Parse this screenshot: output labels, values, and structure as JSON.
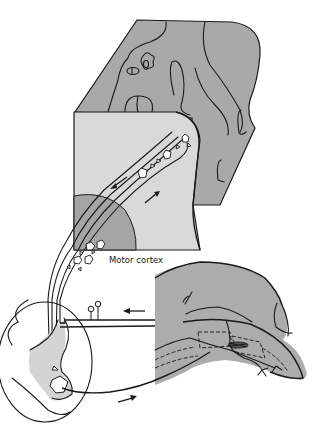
{
  "diagram": {
    "type": "anatomical-schematic",
    "labels": {
      "motor_cortex": "Motor cortex"
    },
    "colors": {
      "brain_surface": "#a9a9a9",
      "cortex_section": "#d9d9d9",
      "cortex_deep_region": "#a5a5a5",
      "spinal_cord_gray": "#d4d4d4",
      "hand": "#acacac",
      "ink": "#1a1a1a",
      "background": "#ffffff"
    },
    "arrows": [
      {
        "id": "descending",
        "direction": "down-left",
        "location": "motor cortex section, upper tract"
      },
      {
        "id": "ascending",
        "direction": "up-right",
        "location": "motor cortex section, lower tract"
      },
      {
        "id": "afferent-left",
        "direction": "left",
        "location": "sensory fiber from finger"
      },
      {
        "id": "efferent-right",
        "direction": "right",
        "location": "motor fiber to finger"
      }
    ],
    "components": [
      "brain-surface-block",
      "motor-cortex-section",
      "pyramidal-neurons",
      "corticospinal-tract",
      "spinal-cord-cross-section",
      "motor-neuron",
      "sensory-ganglion-cells",
      "hand-and-finger",
      "muscle-spindle"
    ]
  }
}
